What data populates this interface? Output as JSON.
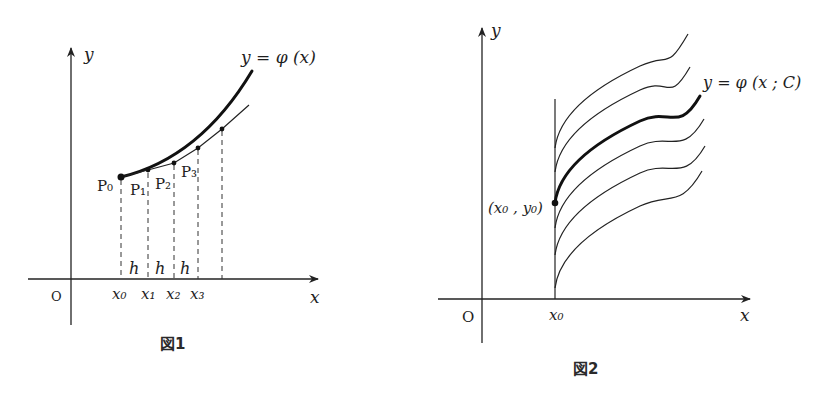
{
  "figure1": {
    "caption": "図1",
    "y_axis_label": "y",
    "x_axis_label": "x",
    "origin_label": "O",
    "curve_label": "y = φ (x)",
    "points": [
      "P₀",
      "P₁",
      "P₂",
      "P₃"
    ],
    "x_ticks": [
      "x₀",
      "x₁",
      "x₂",
      "x₃"
    ],
    "step_labels": [
      "h",
      "h",
      "h"
    ]
  },
  "figure2": {
    "caption": "図2",
    "y_axis_label": "y",
    "x_axis_label": "x",
    "origin_label": "O",
    "x0_label": "x₀",
    "initial_point_label": "(x₀ , y₀)",
    "curve_label": "y = φ (x ; C)",
    "family_curve_count": 6,
    "highlighted_curve_index": 2
  }
}
